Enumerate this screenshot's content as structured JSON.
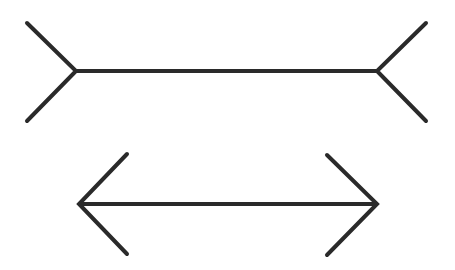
{
  "title": "",
  "figures": [
    {
      "name": "fins-out-line",
      "shaft": {
        "x1": 76,
        "y1": 71,
        "x2": 377,
        "y2": 71
      },
      "left_fin": [
        [
          27,
          23
        ],
        [
          76,
          71
        ],
        [
          27,
          121
        ]
      ],
      "right_fin": [
        [
          426,
          23
        ],
        [
          377,
          71
        ],
        [
          426,
          121
        ]
      ]
    },
    {
      "name": "arrowheads-in-line",
      "shaft": {
        "x1": 79,
        "y1": 204,
        "x2": 377,
        "y2": 204
      },
      "left_fin": [
        [
          127,
          154
        ],
        [
          79,
          204
        ],
        [
          127,
          254
        ]
      ],
      "right_fin": [
        [
          327,
          155
        ],
        [
          377,
          204
        ],
        [
          327,
          255
        ]
      ]
    }
  ],
  "stroke_color": "#2a2a2a",
  "background": "#ffffff"
}
